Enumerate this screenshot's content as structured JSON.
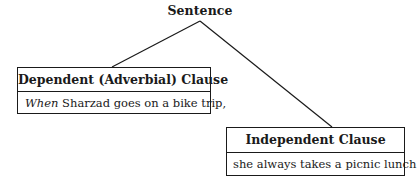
{
  "diagram": {
    "type": "tree",
    "root": {
      "label": "Sentence"
    },
    "nodes": [
      {
        "id": "dependent",
        "title": "Dependent (Adverbial) Clause",
        "text_italic": "When",
        "text_rest": " Sharzad goes on a bike trip,"
      },
      {
        "id": "independent",
        "title": "Independent Clause",
        "text": "she always takes a picnic lunch."
      }
    ],
    "edges": [
      {
        "from": "root",
        "to": "dependent"
      },
      {
        "from": "root",
        "to": "independent"
      }
    ],
    "colors": {
      "stroke": "#1a1a1a",
      "background": "#ffffff"
    }
  }
}
